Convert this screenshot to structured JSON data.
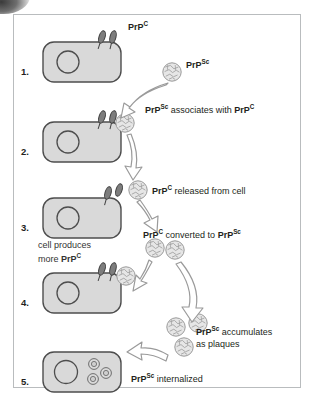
{
  "figure": {
    "border_color": "#b9bcbe",
    "cell_fill": "#d9d9d9",
    "cell_stroke": "#4d4d4d",
    "aggregate_fill": "#e3e3e3",
    "aggregate_stroke": "#8a8a8a",
    "arrow_stroke": "#8a8a8a",
    "text_color": "#231f20"
  },
  "steps": [
    {
      "number": "1.",
      "name": "cell-with-prpc"
    },
    {
      "number": "2.",
      "name": "prpsc-binds-prpc"
    },
    {
      "number": "3.",
      "name": "cell-produces-more-prpc"
    },
    {
      "number": "4.",
      "name": "cell-with-prpc-and-prpsc"
    },
    {
      "number": "5.",
      "name": "prpsc-internalized"
    }
  ],
  "labels": {
    "prpc_tag": {
      "base": "PrP",
      "sup": "C"
    },
    "prpsc_tag": {
      "base": "PrP",
      "sup": "Sc"
    },
    "associates": {
      "a_base": "PrP",
      "a_sup": "Sc",
      "mid": " associates with ",
      "b_base": "PrP",
      "b_sup": "C"
    },
    "released": {
      "a_base": "PrP",
      "a_sup": "C",
      "mid": " released from cell"
    },
    "converted": {
      "a_base": "PrP",
      "a_sup": "C",
      "mid": " converted to ",
      "b_base": "PrP",
      "b_sup": "Sc"
    },
    "cell_produces": {
      "line1": "cell produces",
      "line2_pre": "more ",
      "line2_base": "PrP",
      "line2_sup": "C"
    },
    "accumulates": {
      "a_base": "PrP",
      "a_sup": "Sc",
      "mid": " accumulates",
      "line2": "as plaques"
    },
    "internalized": {
      "a_base": "PrP",
      "a_sup": "Sc",
      "mid": " internalized"
    }
  }
}
